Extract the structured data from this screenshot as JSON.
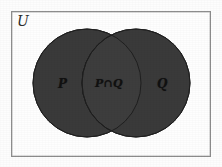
{
  "figure": {
    "type": "venn-diagram",
    "background_color": "#fdfdfd",
    "frame": {
      "label": "U",
      "label_meaning": "universal-set",
      "border_color": "#8d8d8d",
      "fill_color": "#fefefe"
    },
    "sets": [
      {
        "id": "P",
        "label": "P",
        "position": "left",
        "fill_color": "#3a3a3a",
        "stroke_color": "#222222"
      },
      {
        "id": "Q",
        "label": "Q",
        "position": "right",
        "fill_color": "#3a3a3a",
        "stroke_color": "#222222"
      }
    ],
    "regions": [
      {
        "id": "intersection",
        "label": "P∩Q",
        "position": "center",
        "fill_color": "#3d3d3d",
        "stroke_color": "#1d1d1d",
        "shaded": true
      }
    ],
    "geometry": {
      "circle_radius": 54,
      "left_circle_center_x": 87,
      "right_circle_center_x": 136,
      "circle_center_y": 83,
      "lens_left_x": 93,
      "lens_right_x": 129
    }
  }
}
